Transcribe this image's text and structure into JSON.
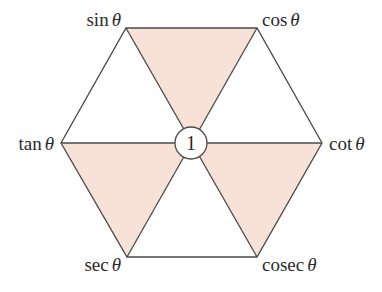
{
  "diagram": {
    "type": "trig-identity-hexagon",
    "center_label": "1",
    "vertices": [
      {
        "id": "top-left",
        "func": "sin",
        "var": "θ"
      },
      {
        "id": "top-right",
        "func": "cos",
        "var": "θ"
      },
      {
        "id": "right",
        "func": "cot",
        "var": "θ"
      },
      {
        "id": "bottom-right",
        "func": "cosec",
        "var": "θ"
      },
      {
        "id": "bottom-left",
        "func": "sec",
        "var": "θ"
      },
      {
        "id": "left",
        "func": "tan",
        "var": "θ"
      }
    ],
    "shaded_triangles": [
      "top",
      "bottom-left",
      "bottom-right"
    ],
    "colors": {
      "shade": "#f8e2d8",
      "line": "#4a4a4a",
      "text": "#2a2a2a",
      "background": "#ffffff"
    }
  }
}
